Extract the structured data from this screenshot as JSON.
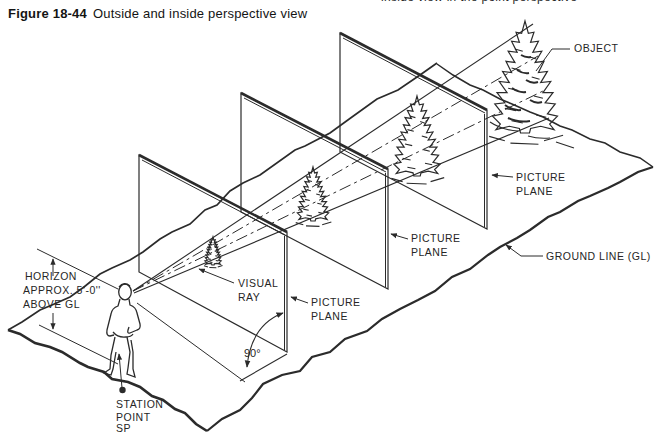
{
  "caption": {
    "figure_number": "Figure 18-44",
    "title": "Outside and inside perspective view"
  },
  "top_cropped_text": "inside view in the point perspective",
  "diagram": {
    "labels": {
      "object": "OBJECT",
      "picture_plane_line1": "PICTURE",
      "picture_plane_line2": "PLANE",
      "ground_line": "GROUND LINE (GL)",
      "visual_ray_line1": "VISUAL",
      "visual_ray_line2": "RAY",
      "horizon_line1": "HORIZON",
      "horizon_line2": "APPROX. 5'-0''",
      "horizon_line3": "ABOVE GL",
      "right_angle": "90°",
      "station_point_line1": "STATION",
      "station_point_line2": "POINT",
      "station_point_line3": "SP"
    },
    "colors": {
      "ink": "#2b2b2b",
      "background": "#ffffff"
    }
  }
}
